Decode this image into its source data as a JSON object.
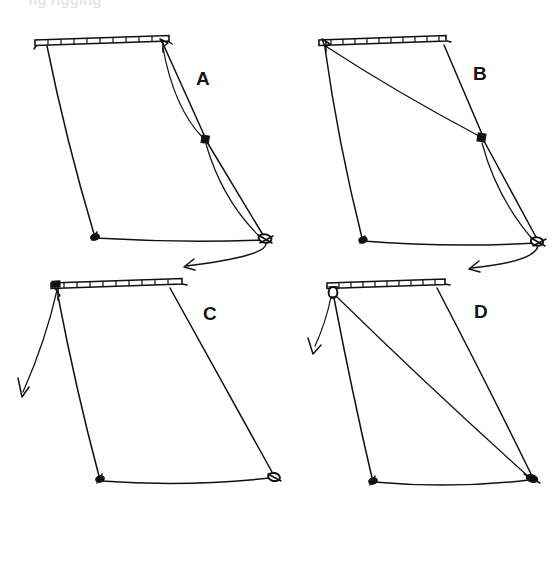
{
  "figure": {
    "background_color": "#ffffff",
    "ink_color": "#111111",
    "width": 559,
    "height": 585,
    "clipped_header_text": "fig  rigging"
  },
  "panels": [
    {
      "id": "panel-a",
      "label": "A",
      "label_x": 196,
      "label_y": 85,
      "description": "Sail with yard at top; two curved sheet lines running from head cringle through an intermediate square knot down to the clew ring, arrow pulling down-left",
      "spar": {
        "x1": 36,
        "y1": 42,
        "x2": 167,
        "y2": 39,
        "rungs": 10
      },
      "knots": [
        {
          "name": "intermediate-square-knot",
          "type": "square",
          "x": 205,
          "y": 139
        },
        {
          "name": "tack-knot",
          "type": "blob",
          "x": 94,
          "y": 236
        },
        {
          "name": "clew-ring",
          "type": "ring",
          "x": 264,
          "y": 238
        }
      ],
      "arrow": {
        "name": "pull-arrow",
        "x": 185,
        "y": 268,
        "direction": "down-left"
      }
    },
    {
      "id": "panel-b",
      "label": "B",
      "label_x": 473,
      "label_y": 80,
      "description": "Sail with yard at top; a straight diagonal from the head down to a square knot, then continuing with a bowed line to the clew ring, arrow pulling down-left",
      "spar": {
        "x1": 320,
        "y1": 42,
        "x2": 444,
        "y2": 39,
        "rungs": 11
      },
      "knots": [
        {
          "name": "intermediate-square-knot",
          "type": "square",
          "x": 481,
          "y": 137
        },
        {
          "name": "tack-knot",
          "type": "blob",
          "x": 362,
          "y": 240
        },
        {
          "name": "clew-ring",
          "type": "ring",
          "x": 537,
          "y": 241
        }
      ],
      "arrow": {
        "name": "pull-arrow",
        "x": 470,
        "y": 270,
        "direction": "down-left"
      }
    },
    {
      "id": "panel-c",
      "label": "C",
      "label_x": 203,
      "label_y": 320,
      "description": "Plain trapezoidal sail with yard at top; a single slack line from the head falling away to the lower left with an arrow",
      "spar": {
        "x1": 52,
        "y1": 285,
        "x2": 180,
        "y2": 282
      },
      "knots": [
        {
          "name": "tack-knot",
          "type": "blob",
          "x": 99,
          "y": 479
        },
        {
          "name": "clew-ring",
          "type": "ring",
          "x": 272,
          "y": 476
        }
      ],
      "arrow": {
        "name": "slack-line-arrow",
        "x": 16,
        "y": 401,
        "direction": "down-left"
      }
    },
    {
      "id": "panel-d",
      "label": "D",
      "label_x": 474,
      "label_y": 318,
      "description": "Trapezoidal sail with yard at top; a ring at the head with a straight diagonal brace running to the clew corner, plus a line falling away to the lower left with an arrow",
      "spar": {
        "x1": 328,
        "y1": 285,
        "x2": 443,
        "y2": 283
      },
      "knots": [
        {
          "name": "head-ring",
          "type": "ring",
          "x": 333,
          "y": 292
        },
        {
          "name": "tack-knot",
          "type": "blob",
          "x": 372,
          "y": 481
        },
        {
          "name": "clew-knot",
          "type": "blob",
          "x": 531,
          "y": 478
        }
      ],
      "arrow": {
        "name": "slack-line-arrow",
        "x": 312,
        "y": 353,
        "direction": "down-left"
      }
    }
  ]
}
